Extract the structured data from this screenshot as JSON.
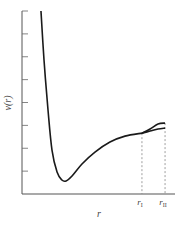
{
  "chart_data": {
    "type": "line",
    "title": "",
    "xlabel": "r",
    "ylabel": "v(r)",
    "xlim": [
      0,
      10
    ],
    "ylim": [
      0,
      8
    ],
    "grid": false,
    "legend": "none",
    "y_ticks": [
      1,
      2,
      3,
      4,
      5,
      6,
      7,
      8
    ],
    "y_tick_labels": [],
    "x_ticks": [
      {
        "value": 7.84,
        "label": "r",
        "sub": "I"
      },
      {
        "value": 9.35,
        "label": "r",
        "sub": "II"
      }
    ],
    "series": [
      {
        "name": "main-curve",
        "x": [
          1.24,
          1.44,
          1.7,
          1.96,
          2.29,
          2.61,
          2.88,
          3.27,
          3.92,
          4.77,
          5.75,
          6.73,
          7.84
        ],
        "y": [
          8.0,
          5.85,
          3.67,
          1.92,
          0.96,
          0.61,
          0.57,
          0.79,
          1.31,
          1.83,
          2.27,
          2.53,
          2.66
        ]
      },
      {
        "name": "upper-branch",
        "x": [
          7.84,
          8.37,
          8.89,
          9.35
        ],
        "y": [
          2.66,
          2.84,
          3.06,
          3.1
        ]
      },
      {
        "name": "lower-branch",
        "x": [
          7.84,
          8.37,
          8.89,
          9.35
        ],
        "y": [
          2.66,
          2.75,
          2.84,
          2.88
        ]
      }
    ],
    "dashed_verticals": [
      7.84,
      9.35
    ]
  }
}
